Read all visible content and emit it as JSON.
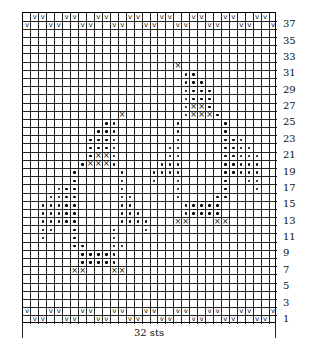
{
  "chart": {
    "columns": 32,
    "rows": 38,
    "stitch_count_label": "32 sts",
    "row_labels": [
      "37",
      "35",
      "33",
      "31",
      "29",
      "27",
      "25",
      "23",
      "21",
      "19",
      "17",
      "15",
      "13",
      "11",
      "9",
      "7",
      "5",
      "3",
      "1"
    ],
    "legend_symbols": {
      "V": "slip-stitch-v",
      "X": "cross-x",
      "o": "dot"
    },
    "symbol_glyphs": {
      "V": "v",
      "X": "×"
    },
    "pattern_rows": {
      "38": {
        "V": [
          2,
          3,
          6,
          7,
          10,
          11,
          14,
          15,
          18,
          19,
          22,
          23,
          26,
          27,
          30,
          31
        ]
      },
      "37": {
        "V": [
          1,
          4,
          5,
          8,
          9,
          12,
          13,
          16,
          17,
          20,
          21,
          24,
          25,
          28,
          29,
          32
        ]
      },
      "32": {
        "X": [
          20
        ]
      },
      "31": {
        "o": [
          21,
          22
        ]
      },
      "30": {
        "o": [
          21,
          22,
          23
        ]
      },
      "29": {
        "o": [
          21,
          22,
          23,
          24
        ]
      },
      "28": {
        "o": [
          21,
          22,
          23,
          24
        ]
      },
      "27": {
        "o": [
          21,
          24
        ],
        "X": [
          22,
          23
        ]
      },
      "26": {
        "X": [
          13,
          22,
          23,
          24
        ],
        "o": [
          21,
          25
        ]
      },
      "25": {
        "o": [
          11,
          12,
          20,
          26
        ]
      },
      "24": {
        "o": [
          10,
          11,
          12,
          20,
          26
        ]
      },
      "23": {
        "o": [
          9,
          10,
          11,
          12,
          20,
          26,
          27,
          28
        ]
      },
      "22": {
        "o": [
          9,
          10,
          11,
          12,
          19,
          20,
          26,
          27,
          28,
          29
        ]
      },
      "21": {
        "o": [
          9,
          12,
          19,
          20,
          26,
          27,
          28,
          29,
          30
        ],
        "X": [
          10,
          11
        ]
      },
      "20": {
        "o": [
          8,
          12,
          18,
          19,
          20,
          26,
          27,
          28,
          29,
          30
        ],
        "X": [
          9,
          10,
          11
        ]
      },
      "19": {
        "o": [
          7,
          13,
          17,
          18,
          19,
          20,
          26,
          27,
          28,
          29,
          30
        ]
      },
      "18": {
        "o": [
          7,
          13,
          17,
          20,
          26,
          29,
          30
        ]
      },
      "17": {
        "o": [
          5,
          6,
          7,
          13,
          20,
          26,
          30
        ]
      },
      "16": {
        "o": [
          4,
          5,
          6,
          7,
          13,
          14,
          20,
          25,
          26
        ]
      },
      "15": {
        "o": [
          3,
          4,
          5,
          6,
          7,
          13,
          14,
          21,
          22,
          23,
          24,
          25
        ]
      },
      "14": {
        "o": [
          3,
          4,
          5,
          6,
          7,
          13,
          14,
          15,
          21,
          22,
          23,
          24,
          25
        ]
      },
      "13": {
        "o": [
          3,
          4,
          5,
          6,
          7,
          13,
          14,
          15,
          16
        ],
        "X": [
          20,
          21,
          25,
          26
        ]
      },
      "12": {
        "o": [
          3,
          4,
          7,
          12,
          16
        ]
      },
      "11": {
        "o": [
          3,
          7,
          12
        ]
      },
      "10": {
        "o": [
          7,
          8,
          12,
          13
        ]
      },
      "9": {
        "o": [
          8,
          9,
          10,
          11,
          12
        ]
      },
      "8": {
        "o": [
          8,
          9,
          10,
          11,
          12
        ]
      },
      "7": {
        "X": [
          7,
          8,
          12,
          13
        ]
      },
      "2": {
        "V": [
          1,
          4,
          5,
          8,
          9,
          12,
          13,
          16,
          17,
          20,
          21,
          24,
          25,
          28,
          29,
          32
        ]
      },
      "1": {
        "V": [
          2,
          3,
          6,
          7,
          10,
          11,
          14,
          15,
          18,
          19,
          22,
          23,
          26,
          27,
          30,
          31
        ]
      }
    }
  }
}
